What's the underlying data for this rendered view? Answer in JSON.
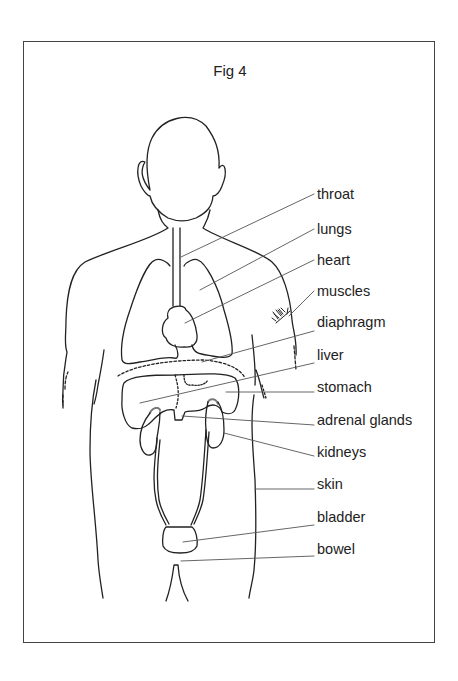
{
  "figure": {
    "title": "Fig 4"
  },
  "labels": [
    {
      "id": "throat",
      "text": "throat",
      "y": 186
    },
    {
      "id": "lungs",
      "text": "lungs",
      "y": 221
    },
    {
      "id": "heart",
      "text": "heart",
      "y": 252
    },
    {
      "id": "muscles",
      "text": "muscles",
      "y": 283
    },
    {
      "id": "diaphragm",
      "text": "diaphragm",
      "y": 314
    },
    {
      "id": "liver",
      "text": "liver",
      "y": 347
    },
    {
      "id": "stomach",
      "text": "stomach",
      "y": 379
    },
    {
      "id": "adrenal-glands",
      "text": "adrenal glands",
      "y": 412
    },
    {
      "id": "kidneys",
      "text": "kidneys",
      "y": 444
    },
    {
      "id": "skin",
      "text": "skin",
      "y": 476
    },
    {
      "id": "bladder",
      "text": "bladder",
      "y": 509
    },
    {
      "id": "bowel",
      "text": "bowel",
      "y": 541
    }
  ],
  "colors": {
    "line": "#222222",
    "leader": "#555555",
    "frame": "#444444",
    "background": "#ffffff"
  }
}
